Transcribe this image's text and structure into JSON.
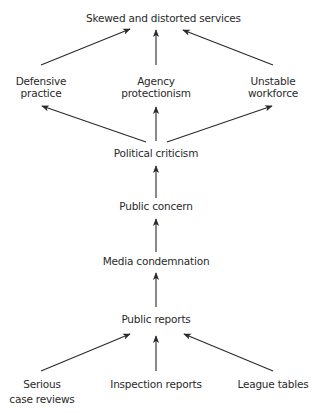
{
  "diagram": {
    "type": "flow",
    "nodes": {
      "skewed": "Skewed and distorted services",
      "defensive_1": "Defensive",
      "defensive_2": "practice",
      "agency_1": "Agency",
      "agency_2": "protectionism",
      "unstable_1": "Unstable",
      "unstable_2": "workforce",
      "political": "Political criticism",
      "concern": "Public concern",
      "media": "Media condemnation",
      "reports": "Public reports",
      "serious_1": "Serious",
      "serious_2": "case reviews",
      "inspection": "Inspection reports",
      "league": "League tables"
    },
    "edges": [
      [
        "Defensive practice",
        "Skewed and distorted services"
      ],
      [
        "Agency protectionism",
        "Skewed and distorted services"
      ],
      [
        "Unstable workforce",
        "Skewed and distorted services"
      ],
      [
        "Political criticism",
        "Defensive practice"
      ],
      [
        "Political criticism",
        "Agency protectionism"
      ],
      [
        "Political criticism",
        "Unstable workforce"
      ],
      [
        "Public concern",
        "Political criticism"
      ],
      [
        "Media condemnation",
        "Public concern"
      ],
      [
        "Public reports",
        "Media condemnation"
      ],
      [
        "Serious case reviews",
        "Public reports"
      ],
      [
        "Inspection reports",
        "Public reports"
      ],
      [
        "League tables",
        "Public reports"
      ]
    ],
    "colors": {
      "text": "#2a2a2a",
      "arrow": "#2a2a2a",
      "background": "#ffffff"
    }
  }
}
